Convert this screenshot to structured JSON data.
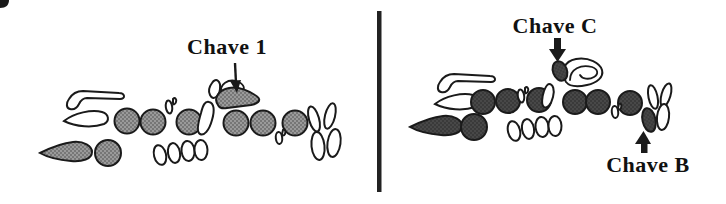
{
  "figure": {
    "left_panel": {
      "annotation": {
        "label": "Chave 1",
        "arrow_direction": "down"
      }
    },
    "right_panel": {
      "top_annotation": {
        "label": "Chave C",
        "arrow_direction": "down"
      },
      "bottom_annotation": {
        "label": "Chave B",
        "arrow_direction": "up"
      }
    },
    "colors": {
      "background": "#ffffff",
      "outline": "#1a1a1a",
      "divider": "#222222",
      "label_text": "#111111",
      "left_shapes_fill": "#9a9a9a",
      "left_shapes_dot": "#4a4a4a",
      "right_shapes_fill": "#3a3a3a",
      "right_shapes_dot": "#606060"
    }
  }
}
